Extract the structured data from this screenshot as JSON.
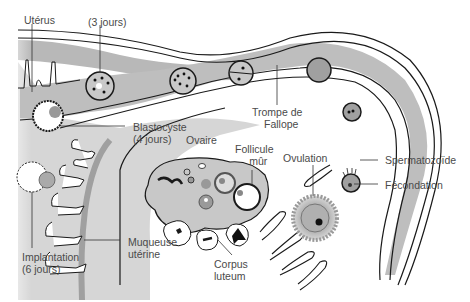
{
  "diagram": {
    "colors": {
      "outline": "#1a1a1a",
      "tube_fill": "#bdbdbd",
      "tube_light": "#d9d9d9",
      "mucosa_shade": "#a8a8a8",
      "ovary_fill": "#c8c8c8",
      "cell_fill": "#9a9a9a",
      "label_text": "#4a4a4a",
      "background": "#ffffff"
    },
    "labels": {
      "uterus": "Utérus",
      "day3": "(3 jours)",
      "tube_line1": "Trompe de",
      "tube_line2": "Fallope",
      "blastocyst_line1": "Blastocyste",
      "blastocyst_line2": "(4 jours)",
      "ovary": "Ovaire",
      "follicle_line1": "Follicule",
      "follicle_line2": "mûr",
      "ovulation": "Ovulation",
      "sperm": "Spermatozoïde",
      "fertilization": "Fécondation",
      "implantation_line1": "Implantation",
      "implantation_line2": "(6 jours)",
      "mucosa_line1": "Muqueuse",
      "mucosa_line2": "utérine",
      "corpus_line1": "Corpus",
      "corpus_line2": "luteum"
    },
    "stages": [
      {
        "name": "fertilization",
        "label": "Fécondation"
      },
      {
        "name": "zygote",
        "label": ""
      },
      {
        "name": "two-cell",
        "label": ""
      },
      {
        "name": "four-cell",
        "label": ""
      },
      {
        "name": "morula",
        "label": "(3 jours)"
      },
      {
        "name": "blastocyst",
        "label": "Blastocyste (4 jours)"
      },
      {
        "name": "implantation",
        "label": "Implantation (6 jours)"
      }
    ]
  }
}
